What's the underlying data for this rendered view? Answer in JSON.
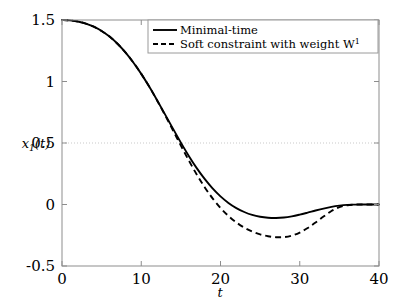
{
  "chart_data": {
    "type": "line",
    "title": "",
    "xlabel": "t",
    "ylabel": "x_1(t)",
    "ylabel_display": "x₁(t)",
    "xlim": [
      0,
      40
    ],
    "ylim": [
      -0.5,
      1.5
    ],
    "xticks": [
      0,
      10,
      20,
      30,
      40
    ],
    "xtick_labels": [
      "0",
      "10",
      "20",
      "30",
      "40"
    ],
    "yticks": [
      -0.5,
      0,
      0.5,
      1,
      1.5
    ],
    "ytick_labels": [
      "-0.5",
      "0",
      "0.5",
      "1",
      "1.5"
    ],
    "grid": false,
    "gridlines_y": [
      0.5
    ],
    "legend_position": "top-right",
    "series": [
      {
        "name": "Minimal-time",
        "style": "solid",
        "color": "#000000",
        "x": [
          0,
          1,
          2,
          3,
          4,
          5,
          6,
          7,
          8,
          9,
          10,
          11,
          12,
          13,
          14,
          15,
          16,
          17,
          18,
          19,
          20,
          21,
          22,
          23,
          24,
          25,
          26,
          27,
          28,
          29,
          30,
          31,
          32,
          33,
          34,
          35,
          36,
          37,
          38,
          39,
          40
        ],
        "values": [
          1.5,
          1.497,
          1.488,
          1.471,
          1.446,
          1.411,
          1.365,
          1.307,
          1.237,
          1.155,
          1.062,
          0.959,
          0.848,
          0.733,
          0.617,
          0.503,
          0.395,
          0.296,
          0.208,
          0.131,
          0.066,
          0.013,
          -0.029,
          -0.061,
          -0.085,
          -0.1,
          -0.108,
          -0.11,
          -0.106,
          -0.096,
          -0.082,
          -0.066,
          -0.049,
          -0.033,
          -0.019,
          -0.009,
          -0.003,
          -0.001,
          0.0,
          0.0,
          0.0
        ]
      },
      {
        "name": "Soft constraint with weight W",
        "name_superscript": "1",
        "style": "dashed",
        "color": "#000000",
        "x": [
          0,
          1,
          2,
          3,
          4,
          5,
          6,
          7,
          8,
          9,
          10,
          11,
          12,
          13,
          14,
          15,
          16,
          17,
          18,
          19,
          20,
          21,
          22,
          23,
          24,
          25,
          26,
          27,
          28,
          29,
          30,
          31,
          32,
          33,
          34,
          35,
          36,
          37,
          38,
          39,
          40
        ],
        "values": [
          1.5,
          1.497,
          1.488,
          1.471,
          1.446,
          1.411,
          1.365,
          1.307,
          1.237,
          1.155,
          1.062,
          0.959,
          0.846,
          0.727,
          0.604,
          0.479,
          0.358,
          0.244,
          0.141,
          0.05,
          -0.028,
          -0.093,
          -0.146,
          -0.188,
          -0.22,
          -0.243,
          -0.258,
          -0.266,
          -0.265,
          -0.253,
          -0.228,
          -0.191,
          -0.146,
          -0.098,
          -0.053,
          -0.021,
          -0.006,
          -0.001,
          0.0,
          0.0,
          0.0
        ]
      }
    ],
    "annotations": []
  },
  "legend": {
    "entries": [
      {
        "label": "Minimal-time",
        "superscript": "",
        "style": "solid"
      },
      {
        "label": "Soft constraint with weight W",
        "superscript": "1",
        "style": "dashed"
      }
    ]
  }
}
